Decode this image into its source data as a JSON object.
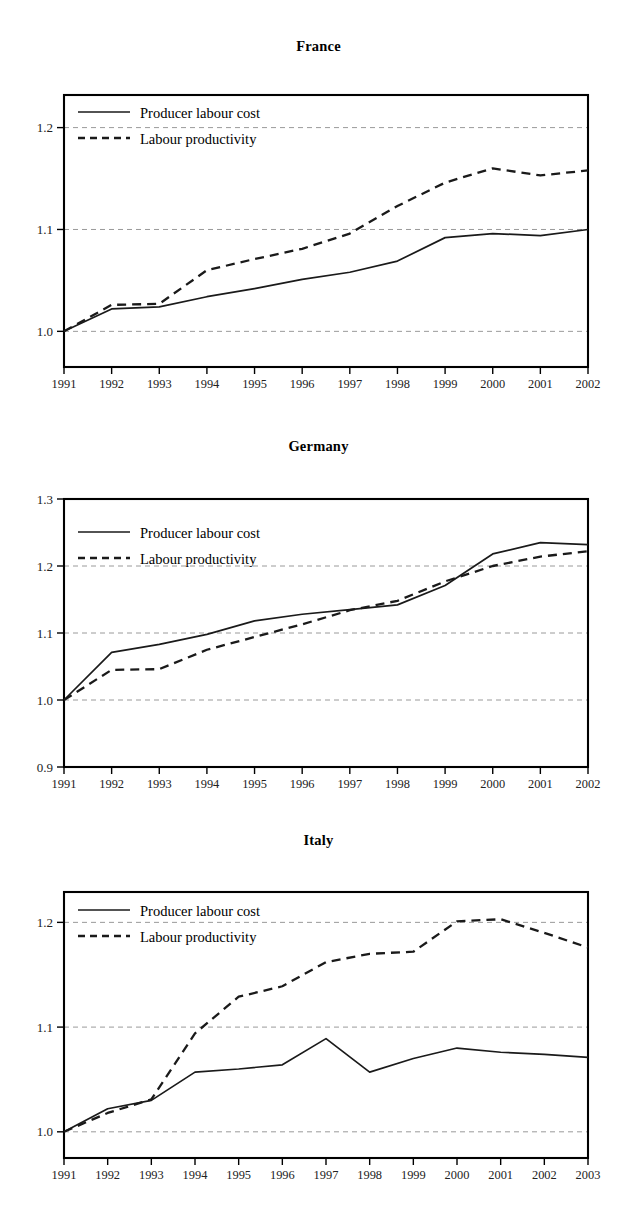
{
  "figure": {
    "background_color": "#ffffff",
    "series_colors": {
      "producer_labour_cost": "#1a1a1a",
      "labour_productivity": "#1a1a1a"
    },
    "gridline_color": "#9a9a9a",
    "axis_color": "#000000"
  },
  "panels": [
    {
      "id": "france",
      "title": "France",
      "legend": [
        {
          "label": "Producer labour cost",
          "style": "solid"
        },
        {
          "label": "Labour productivity",
          "style": "dashed"
        }
      ],
      "chart_data": {
        "type": "line",
        "title": "France",
        "xlabel": "",
        "ylabel": "",
        "grid": true,
        "legend_position": "top-left inside",
        "x": [
          1991,
          1992,
          1993,
          1994,
          1995,
          1996,
          1997,
          1998,
          1999,
          2000,
          2001,
          2002
        ],
        "categories": [
          "1991",
          "1992",
          "1993",
          "1994",
          "1995",
          "1996",
          "1997",
          "1998",
          "1999",
          "2000",
          "2001",
          "2002"
        ],
        "xtick_labels": [
          "1991",
          "1992",
          "1993",
          "1994",
          "1995",
          "1996",
          "1997",
          "1998",
          "1999",
          "2000",
          "2001",
          "2002"
        ],
        "ytick_labels": [
          "1.0",
          "1.1",
          "1.2"
        ],
        "yticks": [
          1.0,
          1.1,
          1.2
        ],
        "ylim": [
          0.965,
          1.232
        ],
        "xlim": [
          1991,
          2002
        ],
        "series": [
          {
            "name": "Producer labour cost",
            "style": "solid",
            "values": [
              1.0,
              1.022,
              1.024,
              1.034,
              1.042,
              1.051,
              1.058,
              1.069,
              1.092,
              1.096,
              1.094,
              1.1
            ]
          },
          {
            "name": "Labour productivity",
            "style": "dashed",
            "values": [
              1.0,
              1.026,
              1.027,
              1.06,
              1.071,
              1.081,
              1.096,
              1.123,
              1.146,
              1.16,
              1.153,
              1.158
            ]
          }
        ]
      }
    },
    {
      "id": "germany",
      "title": "Germany",
      "legend": [
        {
          "label": "Producer labour cost",
          "style": "solid"
        },
        {
          "label": "Labour productivity",
          "style": "dashed"
        }
      ],
      "chart_data": {
        "type": "line",
        "title": "Germany",
        "xlabel": "",
        "ylabel": "",
        "grid": true,
        "legend_position": "top-left inside",
        "x": [
          1991,
          1992,
          1993,
          1994,
          1995,
          1996,
          1997,
          1998,
          1999,
          2000,
          2001,
          2002
        ],
        "categories": [
          "1991",
          "1992",
          "1993",
          "1994",
          "1995",
          "1996",
          "1997",
          "1998",
          "1999",
          "2000",
          "2001",
          "2002"
        ],
        "xtick_labels": [
          "1991",
          "1992",
          "1993",
          "1994",
          "1995",
          "1996",
          "1997",
          "1998",
          "1999",
          "2000",
          "2001",
          "2002"
        ],
        "ytick_labels": [
          "0.9",
          "1.0",
          "1.1",
          "1.2",
          "1.3"
        ],
        "yticks": [
          0.9,
          1.0,
          1.1,
          1.2,
          1.3
        ],
        "ylim": [
          0.9,
          1.3
        ],
        "xlim": [
          1991,
          2002
        ],
        "series": [
          {
            "name": "Producer labour cost",
            "style": "solid",
            "values": [
              1.0,
              1.071,
              1.083,
              1.098,
              1.118,
              1.128,
              1.135,
              1.142,
              1.171,
              1.218,
              1.235,
              1.232
            ]
          },
          {
            "name": "Labour productivity",
            "style": "dashed",
            "values": [
              1.0,
              1.045,
              1.046,
              1.075,
              1.094,
              1.113,
              1.134,
              1.148,
              1.177,
              1.2,
              1.214,
              1.222
            ]
          }
        ]
      }
    },
    {
      "id": "italy",
      "title": "Italy",
      "legend": [
        {
          "label": "Producer labour cost",
          "style": "solid"
        },
        {
          "label": "Labour productivity",
          "style": "dashed"
        }
      ],
      "chart_data": {
        "type": "line",
        "title": "Italy",
        "xlabel": "",
        "ylabel": "",
        "grid": true,
        "legend_position": "top-left inside",
        "x": [
          1991,
          1992,
          1993,
          1994,
          1995,
          1996,
          1997,
          1998,
          1999,
          2000,
          2001,
          2002,
          2003
        ],
        "categories": [
          "1991",
          "1992",
          "1993",
          "1994",
          "1995",
          "1996",
          "1997",
          "1998",
          "1999",
          "2000",
          "2001",
          "2002",
          "2003"
        ],
        "xtick_labels": [
          "1991",
          "1992",
          "1993",
          "1994",
          "1995",
          "1996",
          "1997",
          "1998",
          "1999",
          "2000",
          "2001",
          "2002",
          "2003"
        ],
        "ytick_labels": [
          "1.0",
          "1.1",
          "1.2"
        ],
        "yticks": [
          1.0,
          1.1,
          1.2
        ],
        "ylim": [
          0.975,
          1.229
        ],
        "xlim": [
          1991,
          2003
        ],
        "series": [
          {
            "name": "Producer labour cost",
            "style": "solid",
            "values": [
              1.0,
              1.022,
              1.03,
              1.057,
              1.06,
              1.064,
              1.089,
              1.057,
              1.07,
              1.08,
              1.076,
              1.074,
              1.071
            ]
          },
          {
            "name": "Labour productivity",
            "style": "dashed",
            "values": [
              1.0,
              1.018,
              1.031,
              1.094,
              1.129,
              1.139,
              1.162,
              1.17,
              1.172,
              1.201,
              1.203,
              1.19,
              1.176
            ]
          }
        ]
      }
    }
  ]
}
